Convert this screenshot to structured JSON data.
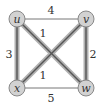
{
  "graph": {
    "nodes": [
      {
        "id": "u",
        "label": "u",
        "x": 17,
        "y": 19
      },
      {
        "id": "v",
        "label": "v",
        "x": 86,
        "y": 19
      },
      {
        "id": "x",
        "label": "x",
        "x": 17,
        "y": 88
      },
      {
        "id": "w",
        "label": "w",
        "x": 86,
        "y": 88
      }
    ],
    "edges": [
      {
        "from": "u",
        "to": "v",
        "weight": "4",
        "highlighted": false
      },
      {
        "from": "u",
        "to": "x",
        "weight": "3",
        "highlighted": true
      },
      {
        "from": "u",
        "to": "w",
        "weight": "1",
        "highlighted": true
      },
      {
        "from": "v",
        "to": "x",
        "weight": "1",
        "highlighted": true
      },
      {
        "from": "v",
        "to": "w",
        "weight": "2",
        "highlighted": true
      },
      {
        "from": "x",
        "to": "w",
        "weight": "5",
        "highlighted": false
      }
    ],
    "colors": {
      "highlight_outer": "#a8a8a8",
      "highlight_inner": "#555555",
      "thin_edge": "#666666",
      "node_fill": "#d0d0d0",
      "node_stroke": "#888888"
    }
  }
}
